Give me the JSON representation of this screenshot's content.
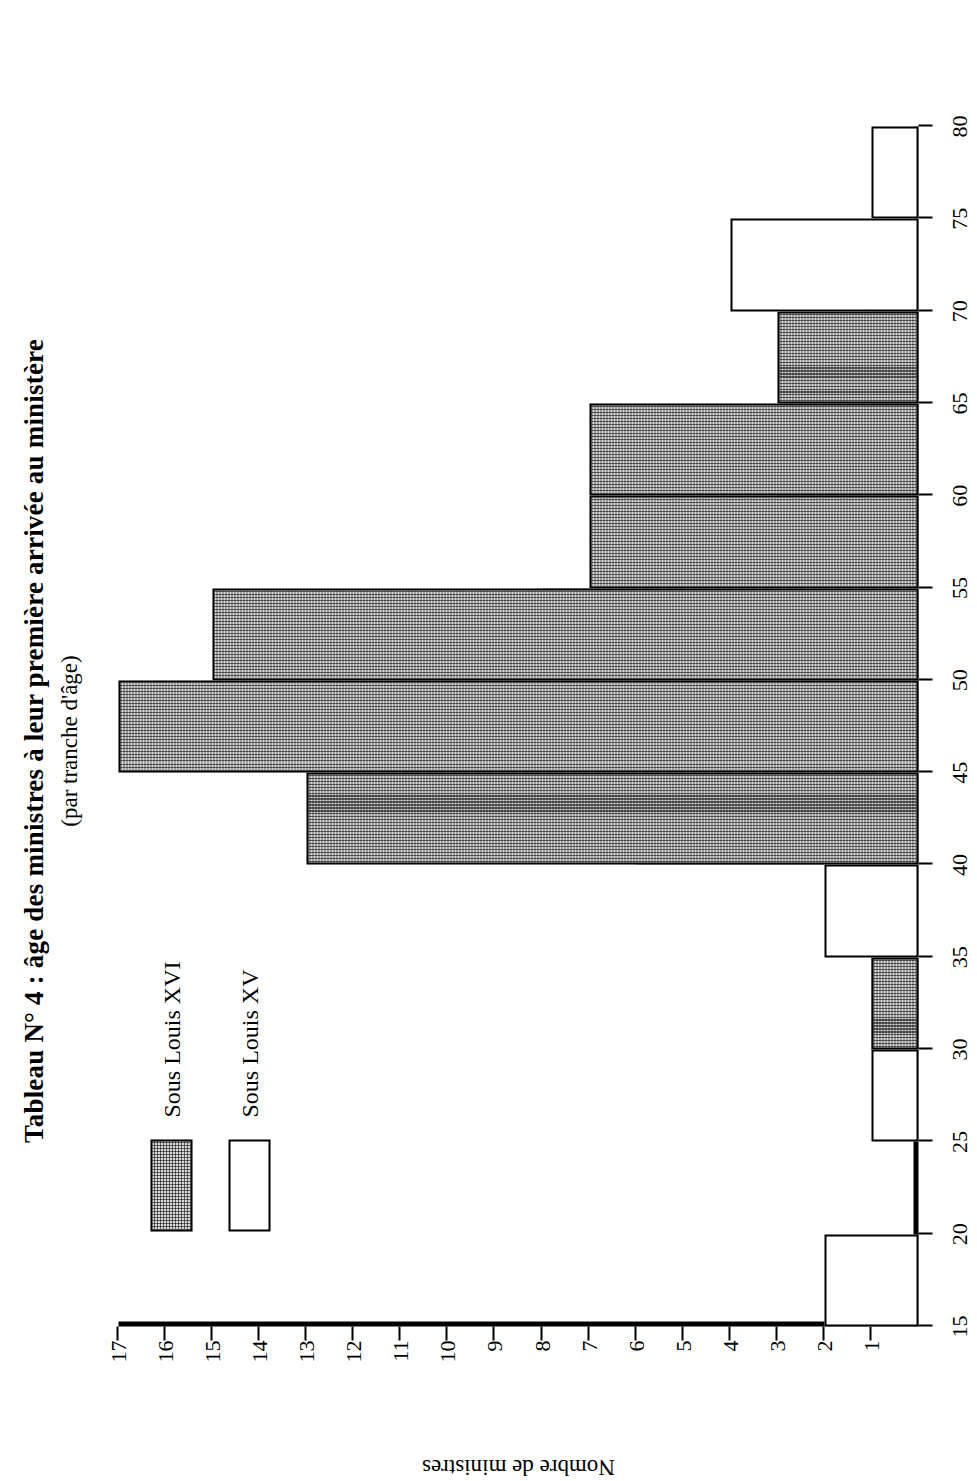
{
  "figure": {
    "title": "Tableau N° 4 : âge des ministres à leur première arrivée au ministère",
    "subtitle": "(par tranche d'âge)"
  },
  "legend": {
    "position": "upper-left",
    "entries": [
      {
        "label": "Sous Louis XVI",
        "swatch": "dotted-gray-swatch",
        "color": "#d9d9d9"
      },
      {
        "label": "Sous Louis XV",
        "swatch": "white-swatch",
        "color": "#ffffff"
      }
    ]
  },
  "axes": {
    "x_title": "Âge des ministres",
    "y_title": "Nombre de ministres",
    "x_ticks": [
      "15",
      "20",
      "25",
      "30",
      "35",
      "40",
      "45",
      "50",
      "55",
      "60",
      "65",
      "70",
      "75",
      "80"
    ],
    "y_ticks": [
      "1",
      "2",
      "3",
      "4",
      "5",
      "6",
      "7",
      "8",
      "9",
      "10",
      "11",
      "12",
      "13",
      "14",
      "15",
      "16",
      "17"
    ]
  },
  "chart_data": {
    "type": "bar",
    "title": "Tableau N° 4 : âge des ministres à leur première arrivée au ministère",
    "subtitle": "(par tranche d'âge)",
    "xlabel": "Âge des ministres",
    "ylabel": "Nombre de ministres",
    "xlim": [
      15,
      80
    ],
    "ylim": [
      0,
      17
    ],
    "bin_width": 5,
    "grid": false,
    "legend_position": "upper-left",
    "orientation": "rotated-90-ccw",
    "overlap": "overlapping-histograms",
    "categories": [
      "15-20",
      "20-25",
      "25-30",
      "30-35",
      "35-40",
      "40-45",
      "45-50",
      "50-55",
      "55-60",
      "60-65",
      "65-70",
      "70-75",
      "75-80"
    ],
    "bin_starts": [
      15,
      20,
      25,
      30,
      35,
      40,
      45,
      50,
      55,
      60,
      65,
      70,
      75
    ],
    "series": [
      {
        "name": "Sous Louis XVI",
        "color": "#d9d9d9",
        "values": [
          0,
          0,
          0,
          1,
          0,
          13,
          17,
          15,
          7,
          7,
          3,
          0,
          0
        ]
      },
      {
        "name": "Sous Louis XV",
        "color": "#ffffff",
        "values": [
          2,
          0,
          1,
          1,
          2,
          6,
          11,
          8,
          3,
          3,
          1,
          4,
          1
        ]
      }
    ]
  }
}
